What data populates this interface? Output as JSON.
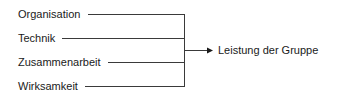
{
  "diagram": {
    "inputs": [
      {
        "label": "Organisation",
        "y": 14,
        "line_start": 88
      },
      {
        "label": "Technik",
        "y": 38,
        "line_start": 62
      },
      {
        "label": "Zusammenarbeit",
        "y": 62,
        "line_start": 108
      },
      {
        "label": "Wirksamkeit",
        "y": 86,
        "line_start": 85
      }
    ],
    "output": {
      "label": "Leistung der Gruppe"
    },
    "colors": {
      "line": "#3a3a3a",
      "text": "#1a1a1a",
      "background": "#ffffff"
    }
  }
}
